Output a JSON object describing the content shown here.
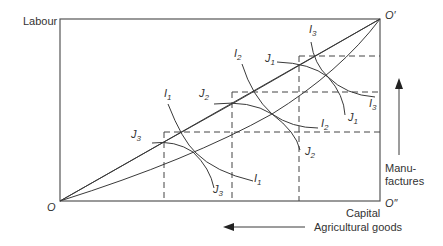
{
  "diagram": {
    "type": "edgeworth-box",
    "axes": {
      "left_label": "Labour",
      "bottom_label": "Capital",
      "origin_bottom_left": "O",
      "origin_top_right": "O′",
      "origin_bottom_right": "O″"
    },
    "arrows": {
      "vertical_label_line1": "Manu-",
      "vertical_label_line2": "factures",
      "horizontal_label": "Agricultural goods"
    },
    "curves": {
      "I1": {
        "letter": "I",
        "sub": "1"
      },
      "I2": {
        "letter": "I",
        "sub": "2"
      },
      "I3": {
        "letter": "I",
        "sub": "3"
      },
      "J1": {
        "letter": "J",
        "sub": "1"
      },
      "J2": {
        "letter": "J",
        "sub": "2"
      },
      "J3": {
        "letter": "J",
        "sub": "3"
      }
    }
  }
}
